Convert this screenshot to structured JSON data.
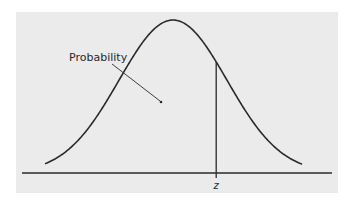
{
  "figure": {
    "panel_color": "#ebebeb",
    "line_color": "#2a2a2a",
    "labels": {
      "area_label": "Probability",
      "z_label": "z"
    }
  },
  "chart_data": {
    "type": "area",
    "title": "",
    "xlabel": "",
    "ylabel": "",
    "annotations": [
      "Probability",
      "z"
    ],
    "curve": "normal density (bell curve)",
    "z_position_sd": 0.8,
    "grid": false,
    "legend": "none"
  }
}
